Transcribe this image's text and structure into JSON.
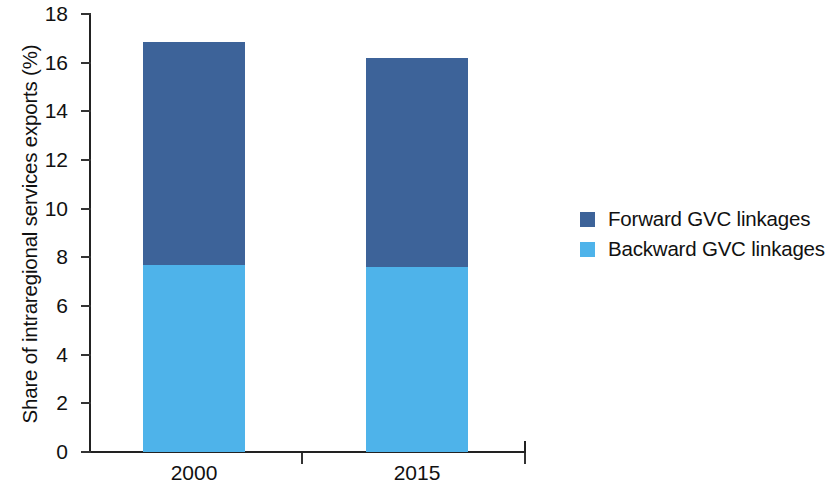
{
  "chart_data": {
    "type": "bar",
    "subtype": "stacked-vertical",
    "title": "",
    "xlabel": "",
    "ylabel": "Share of intraregional services exports (%)",
    "categories": [
      "2000",
      "2015"
    ],
    "series": [
      {
        "name": "Backward GVC linkages",
        "color": "#4eb3ea",
        "values": [
          7.7,
          7.6
        ]
      },
      {
        "name": "Forward GVC linkages",
        "color": "#3d6399",
        "values": [
          9.15,
          8.6
        ]
      }
    ],
    "stack_order_bottom_to_top": [
      "Backward GVC linkages",
      "Forward GVC linkages"
    ],
    "totals": [
      16.85,
      16.2
    ],
    "ylim": [
      0,
      18
    ],
    "ytick_step": 2,
    "yticks": [
      0,
      2,
      4,
      6,
      8,
      10,
      12,
      14,
      16,
      18
    ],
    "ytick_labels": [
      "0",
      "2",
      "4",
      "6",
      "8",
      "10",
      "12",
      "14",
      "16",
      "18"
    ],
    "grid": false,
    "legend_position": "right"
  },
  "axis": {
    "y_title": "Share of intraregional services exports (%)",
    "y_labels": [
      "18",
      "16",
      "14",
      "12",
      "10",
      "8",
      "6",
      "4",
      "2",
      "0"
    ],
    "x_labels": [
      "2000",
      "2015"
    ]
  },
  "legend": {
    "items": [
      {
        "label": "Forward GVC linkages",
        "color": "#3d6399"
      },
      {
        "label": "Backward GVC linkages",
        "color": "#4eb3ea"
      }
    ]
  },
  "colors": {
    "forward": "#3d6399",
    "backward": "#4eb3ea",
    "axis": "#222222",
    "text": "#111111",
    "background": "#ffffff"
  }
}
